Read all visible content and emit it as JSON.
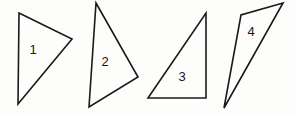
{
  "figure": {
    "background_color": "#fdfdfc",
    "stroke_color": "#1a1a1a",
    "label_color": "#161616",
    "width": 295,
    "height": 115
  },
  "shapes": [
    {
      "label": "1",
      "type": "triangle",
      "points": "19,13 72,39 18,104",
      "label_x": 33,
      "label_y": 51
    },
    {
      "label": "2",
      "type": "triangle",
      "points": "96,3 138,77 89,107",
      "label_x": 105,
      "label_y": 63
    },
    {
      "label": "3",
      "type": "triangle",
      "points": "206,13 206,98 148,98",
      "label_x": 182,
      "label_y": 78
    },
    {
      "label": "4",
      "type": "triangle",
      "points": "283,3 241,15 224,108",
      "label_x": 251,
      "label_y": 33
    }
  ]
}
